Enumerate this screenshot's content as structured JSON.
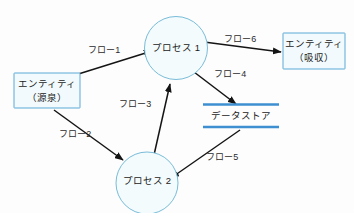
{
  "diagram": {
    "type": "data-flow-diagram",
    "background_color": "#fdfdfd",
    "accent_color": "#3d8fd1",
    "entity_fill": "#f2fafd",
    "entity_stroke": "#5aa9d6",
    "process_fill": "#f3fbfd",
    "process_stroke": "#79bcd8",
    "arrow_color": "#141414"
  },
  "nodes": {
    "source_entity": {
      "kind": "external-entity",
      "line1": "エンティティ",
      "line2": "（源泉）"
    },
    "process_1": {
      "kind": "process",
      "label": "プロセス 1"
    },
    "process_2": {
      "kind": "process",
      "label": "プロセス 2"
    },
    "data_store": {
      "kind": "data-store",
      "label": "データストア"
    },
    "sink_entity": {
      "kind": "external-entity",
      "line1": "エンティティ",
      "line2": "（吸収）"
    }
  },
  "flows": [
    {
      "id": "flow-1",
      "label": "フロー1",
      "from": "source_entity",
      "to": "process_1"
    },
    {
      "id": "flow-2",
      "label": "フロー2",
      "from": "source_entity",
      "to": "process_2"
    },
    {
      "id": "flow-3",
      "label": "フロー3",
      "from": "process_2",
      "to": "process_1"
    },
    {
      "id": "flow-4",
      "label": "フロー4",
      "from": "process_1",
      "to": "data_store"
    },
    {
      "id": "flow-5",
      "label": "フロー5",
      "from": "data_store",
      "to": "process_2"
    },
    {
      "id": "flow-6",
      "label": "フロー6",
      "from": "process_1",
      "to": "sink_entity"
    }
  ]
}
